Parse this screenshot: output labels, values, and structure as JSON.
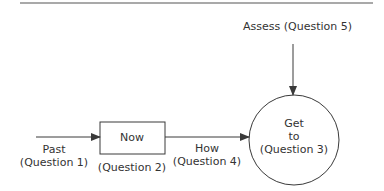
{
  "diagram": {
    "type": "flow",
    "nodes": {
      "now": {
        "label": "Now",
        "caption": "(Question 2)",
        "shape": "rectangle"
      },
      "get_to": {
        "line1": "Get",
        "line2": "to",
        "line3": "(Question 3)",
        "shape": "circle"
      }
    },
    "edges": {
      "past": {
        "line1": "Past",
        "line2": "(Question 1)",
        "from": "start",
        "to": "now"
      },
      "how": {
        "line1": "How",
        "line2": "(Question 4)",
        "from": "now",
        "to": "get_to"
      },
      "assess": {
        "label": "Assess (Question 5)",
        "from": "top",
        "to": "get_to"
      }
    },
    "colors": {
      "stroke": "#3a3a3a",
      "text": "#333333",
      "background": "#ffffff"
    }
  }
}
